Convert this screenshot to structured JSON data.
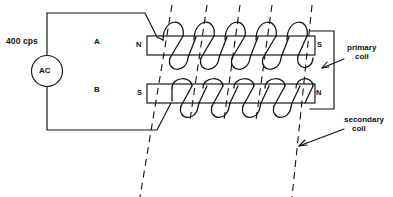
{
  "figure": {
    "type": "electromagnetic-transformer-schematic",
    "width": 393,
    "height": 197,
    "background_color": "#ffffff",
    "line_color": "#111111"
  },
  "source": {
    "frequency_label": "400 cps",
    "symbol_label": "AC",
    "symbol_shape": "circle"
  },
  "regions": {
    "upper_label": "A",
    "lower_label": "B"
  },
  "primary": {
    "left_pole": "N",
    "right_pole": "S",
    "caption_line1": "primary",
    "caption_line2": "coil",
    "turns": 5
  },
  "secondary": {
    "left_pole": "S",
    "right_pole": "N",
    "caption_line1": "secondary",
    "caption_line2": "coil",
    "turns": 5
  },
  "flux_lines": {
    "count": 5,
    "style": "dashed",
    "orientation": "slanted"
  },
  "icons": {
    "ac_source": "ac-source-icon",
    "arrow": "arrow-icon"
  }
}
